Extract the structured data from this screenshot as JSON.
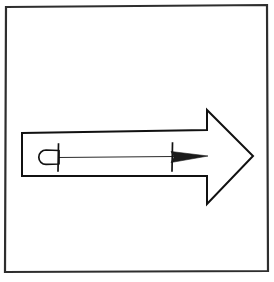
{
  "image": {
    "title": "Right-pointing block arrow line drawing",
    "kind": "line-art-diagram",
    "width": 274,
    "height": 282,
    "background_color": "#ffffff",
    "ink_color": "#111111",
    "frame_color": "#2e2e2e",
    "annotation_line_color": "#2a2a2a"
  },
  "frame": {
    "label": "border-frame",
    "x": 5,
    "y": 6,
    "width": 262,
    "height": 265,
    "stroke_width": 2.2
  },
  "arrow": {
    "label": "block-arrow",
    "direction": "right",
    "shaft": {
      "left_x": 22,
      "right_x": 207,
      "top_y": 132,
      "bottom_y": 176
    },
    "head": {
      "base_x": 207,
      "top_y": 110,
      "bottom_y": 204,
      "tip_x": 253,
      "tip_y": 156
    },
    "outline_points": "22,133 207,130 207,110 253,156 207,204 207,176 22,176",
    "fill": "#ffffff",
    "stroke": "#111111",
    "stroke_width": 2.0
  },
  "annotation": {
    "label": "interior-dimension-marker",
    "baseline": {
      "label": "connector-line",
      "x1": 58,
      "x2": 174,
      "y": 157
    },
    "left_marker": {
      "label": "rounded-pin-head",
      "cap_left_x": 40,
      "cap_right_x": 58,
      "center_y": 157,
      "cap_height": 15,
      "bar_x": 58,
      "bar_top_y": 144,
      "bar_bottom_y": 171
    },
    "right_marker": {
      "label": "needle-dart-tip",
      "bar_x": 172,
      "bar_top_y": 143,
      "bar_bottom_y": 171,
      "tip_x": 208,
      "center_y": 157,
      "tail_half_height": 6
    }
  }
}
